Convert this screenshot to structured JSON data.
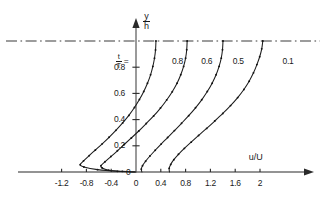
{
  "chart_data": {
    "type": "line",
    "title": "",
    "xlabel": "u/U",
    "ylabel": "y/h",
    "xlim": [
      -1.45,
      2.35
    ],
    "ylim": [
      -0.09,
      1.12
    ],
    "grid": false,
    "legend_position": "inline-right-of-each-curve",
    "legend_prefix_numerator": "t",
    "legend_prefix_denominator": "T",
    "legend_prefix_equals": "=",
    "x_ticks": [
      {
        "value": -1.2,
        "label": "-1.2"
      },
      {
        "value": -0.8,
        "label": "-0.8"
      },
      {
        "value": -0.4,
        "label": "-0.4"
      },
      {
        "value": 0,
        "label": "0"
      },
      {
        "value": 0.4,
        "label": "0.4"
      },
      {
        "value": 0.8,
        "label": "0.8"
      },
      {
        "value": 1.2,
        "label": "1.2"
      },
      {
        "value": 1.6,
        "label": "1.6"
      },
      {
        "value": 2.0,
        "label": "2"
      }
    ],
    "y_ticks": [
      {
        "value": 0,
        "label": "0"
      },
      {
        "value": 0.2,
        "label": "0.2"
      },
      {
        "value": 0.4,
        "label": "0.4"
      },
      {
        "value": 0.6,
        "label": "0.6"
      },
      {
        "value": 0.8,
        "label": "0.8"
      }
    ],
    "reference_line": {
      "value": 1.0,
      "style": "dash-dot",
      "axis": "y"
    },
    "series": [
      {
        "name": "0.8",
        "label": "0.8",
        "label_x": 0.55,
        "label_y": 0.845,
        "marker": "dot",
        "points": [
          {
            "x": -0.015,
            "y": 0.0
          },
          {
            "x": -0.3,
            "y": 0.005
          },
          {
            "x": -0.62,
            "y": 0.018
          },
          {
            "x": -0.84,
            "y": 0.038
          },
          {
            "x": -0.9,
            "y": 0.055
          },
          {
            "x": -0.845,
            "y": 0.085
          },
          {
            "x": -0.755,
            "y": 0.125
          },
          {
            "x": -0.655,
            "y": 0.168
          },
          {
            "x": -0.545,
            "y": 0.215
          },
          {
            "x": -0.435,
            "y": 0.265
          },
          {
            "x": -0.325,
            "y": 0.318
          },
          {
            "x": -0.215,
            "y": 0.375
          },
          {
            "x": -0.115,
            "y": 0.432
          },
          {
            "x": -0.025,
            "y": 0.492
          },
          {
            "x": 0.055,
            "y": 0.553
          },
          {
            "x": 0.125,
            "y": 0.615
          },
          {
            "x": 0.185,
            "y": 0.678
          },
          {
            "x": 0.235,
            "y": 0.742
          },
          {
            "x": 0.272,
            "y": 0.806
          },
          {
            "x": 0.298,
            "y": 0.868
          },
          {
            "x": 0.315,
            "y": 0.932
          },
          {
            "x": 0.322,
            "y": 1.0
          }
        ]
      },
      {
        "name": "0.6",
        "label": "0.6",
        "label_x": 1.02,
        "label_y": 0.845,
        "marker": "dot",
        "points": [
          {
            "x": 0.0,
            "y": 0.0
          },
          {
            "x": -0.22,
            "y": 0.005
          },
          {
            "x": -0.44,
            "y": 0.014
          },
          {
            "x": -0.545,
            "y": 0.03
          },
          {
            "x": -0.565,
            "y": 0.048
          },
          {
            "x": -0.5,
            "y": 0.078
          },
          {
            "x": -0.405,
            "y": 0.118
          },
          {
            "x": -0.3,
            "y": 0.162
          },
          {
            "x": -0.19,
            "y": 0.21
          },
          {
            "x": -0.075,
            "y": 0.26
          },
          {
            "x": 0.045,
            "y": 0.313
          },
          {
            "x": 0.165,
            "y": 0.37
          },
          {
            "x": 0.285,
            "y": 0.428
          },
          {
            "x": 0.395,
            "y": 0.488
          },
          {
            "x": 0.495,
            "y": 0.55
          },
          {
            "x": 0.585,
            "y": 0.613
          },
          {
            "x": 0.662,
            "y": 0.677
          },
          {
            "x": 0.722,
            "y": 0.742
          },
          {
            "x": 0.768,
            "y": 0.806
          },
          {
            "x": 0.8,
            "y": 0.869
          },
          {
            "x": 0.818,
            "y": 0.933
          },
          {
            "x": 0.825,
            "y": 1.0
          }
        ]
      },
      {
        "name": "0.5",
        "label": "0.5",
        "label_x": 1.53,
        "label_y": 0.845,
        "marker": "dot",
        "points": [
          {
            "x": 0.095,
            "y": 0.0
          },
          {
            "x": 0.085,
            "y": 0.022
          },
          {
            "x": 0.105,
            "y": 0.048
          },
          {
            "x": 0.155,
            "y": 0.082
          },
          {
            "x": 0.225,
            "y": 0.122
          },
          {
            "x": 0.31,
            "y": 0.166
          },
          {
            "x": 0.405,
            "y": 0.213
          },
          {
            "x": 0.51,
            "y": 0.263
          },
          {
            "x": 0.62,
            "y": 0.316
          },
          {
            "x": 0.735,
            "y": 0.372
          },
          {
            "x": 0.85,
            "y": 0.43
          },
          {
            "x": 0.96,
            "y": 0.49
          },
          {
            "x": 1.06,
            "y": 0.551
          },
          {
            "x": 1.15,
            "y": 0.614
          },
          {
            "x": 1.228,
            "y": 0.678
          },
          {
            "x": 1.292,
            "y": 0.742
          },
          {
            "x": 1.34,
            "y": 0.806
          },
          {
            "x": 1.375,
            "y": 0.869
          },
          {
            "x": 1.395,
            "y": 0.933
          },
          {
            "x": 1.403,
            "y": 1.0
          }
        ]
      },
      {
        "name": "0.1",
        "label": "0.1",
        "label_x": 2.33,
        "label_y": 0.845,
        "marker": "dot",
        "points": [
          {
            "x": 0.54,
            "y": 0.0
          },
          {
            "x": 0.535,
            "y": 0.028
          },
          {
            "x": 0.56,
            "y": 0.058
          },
          {
            "x": 0.61,
            "y": 0.094
          },
          {
            "x": 0.685,
            "y": 0.135
          },
          {
            "x": 0.78,
            "y": 0.18
          },
          {
            "x": 0.89,
            "y": 0.228
          },
          {
            "x": 1.01,
            "y": 0.279
          },
          {
            "x": 1.14,
            "y": 0.333
          },
          {
            "x": 1.27,
            "y": 0.389
          },
          {
            "x": 1.4,
            "y": 0.447
          },
          {
            "x": 1.525,
            "y": 0.507
          },
          {
            "x": 1.64,
            "y": 0.568
          },
          {
            "x": 1.74,
            "y": 0.63
          },
          {
            "x": 1.825,
            "y": 0.693
          },
          {
            "x": 1.895,
            "y": 0.757
          },
          {
            "x": 1.95,
            "y": 0.82
          },
          {
            "x": 1.995,
            "y": 0.88
          },
          {
            "x": 2.028,
            "y": 0.94
          },
          {
            "x": 2.045,
            "y": 1.0
          }
        ]
      }
    ]
  }
}
